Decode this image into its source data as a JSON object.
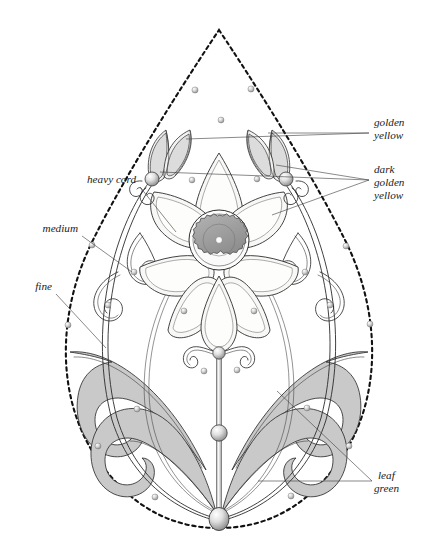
{
  "document": {
    "type": "embroidery-design-diagram",
    "title": "Teardrop floral embroidery motif with thread annotations",
    "background_color": "#ffffff"
  },
  "palette": {
    "outline": "#111111",
    "ink": "#2e2e2e",
    "leaf_fill": "#c9c9c9",
    "leaf_fill_light": "#dcdcdc",
    "petal_fill": "#f8f8f6",
    "center_fill": "#9a9a9a",
    "bead_fill": "#d8d8d8",
    "leader_line": "#3a3a3a",
    "label_text": "#1a1a1a"
  },
  "labels": [
    {
      "id": "golden-yellow",
      "lines": [
        "golden",
        "yellow"
      ],
      "text": "golden yellow",
      "side": "right",
      "x": 374,
      "y": 125
    },
    {
      "id": "dark-golden-yellow",
      "lines": [
        "dark",
        "golden",
        "yellow"
      ],
      "text": "dark golden yellow",
      "side": "right",
      "x": 374,
      "y": 172
    },
    {
      "id": "heavy-cord",
      "lines": [
        "heavy cord"
      ],
      "text": "heavy cord",
      "side": "left",
      "x": 88,
      "y": 182
    },
    {
      "id": "medium",
      "lines": [
        "medium"
      ],
      "text": "medium",
      "side": "left",
      "x": 68,
      "y": 231
    },
    {
      "id": "fine",
      "lines": [
        "fine"
      ],
      "text": "fine",
      "side": "left",
      "x": 44,
      "y": 289
    },
    {
      "id": "leaf-green",
      "lines": [
        "leaf",
        "green"
      ],
      "text": "leaf green",
      "side": "right",
      "x": 382,
      "y": 478
    }
  ],
  "motif": {
    "outline_shape": "teardrop",
    "flower_petal_count": 7,
    "center": "gear-rosette",
    "bud_count": 2,
    "stem_bead_count": 3,
    "scatter_dot_count": 22
  }
}
